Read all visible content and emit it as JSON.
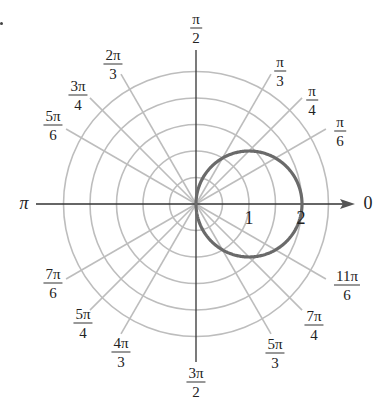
{
  "figure": {
    "colors": {
      "grid": "#bdbdbd",
      "axis": "#333333",
      "curve": "#6a6a6a",
      "text": "#222222"
    },
    "center_px": [
      196,
      204
    ],
    "unit_px": 53,
    "grid_circle_radii": [
      0.5,
      1,
      1.5,
      2,
      2.5
    ],
    "axis_end_label": "0",
    "pi_label": "π"
  },
  "chart_data": {
    "type": "line",
    "coordinate_system": "polar",
    "title": "",
    "curve": {
      "equation": "r = 2cos θ",
      "shape": "circle through origin, diameter 2, centered at (1, 0)",
      "points": [
        {
          "theta": "0",
          "r": 2
        },
        {
          "theta": "π/6",
          "r": 1.732
        },
        {
          "theta": "π/4",
          "r": 1.414
        },
        {
          "theta": "π/3",
          "r": 1
        },
        {
          "theta": "π/2",
          "r": 0
        },
        {
          "theta": "-π/3",
          "r": 1
        },
        {
          "theta": "-π/4",
          "r": 1.414
        },
        {
          "theta": "-π/6",
          "r": 1.732
        }
      ]
    },
    "radial_tick_labels": [
      {
        "value": 1,
        "label": "1"
      },
      {
        "value": 2,
        "label": "2"
      }
    ],
    "angle_labels": [
      {
        "num": "π",
        "den": "2",
        "deg": 90,
        "pos": [
          196,
          28
        ]
      },
      {
        "num": "π",
        "den": "3",
        "deg": 60,
        "pos": [
          280,
          71
        ]
      },
      {
        "num": "π",
        "den": "4",
        "deg": 45,
        "pos": [
          312,
          100
        ]
      },
      {
        "num": "π",
        "den": "6",
        "deg": 30,
        "pos": [
          340,
          131
        ]
      },
      {
        "num": "2π",
        "den": "3",
        "deg": 120,
        "pos": [
          113,
          64
        ]
      },
      {
        "num": "3π",
        "den": "4",
        "deg": 135,
        "pos": [
          78,
          95
        ]
      },
      {
        "num": "5π",
        "den": "6",
        "deg": 150,
        "pos": [
          53,
          125
        ]
      },
      {
        "num": "7π",
        "den": "6",
        "deg": 210,
        "pos": [
          53,
          283
        ]
      },
      {
        "num": "5π",
        "den": "4",
        "deg": 225,
        "pos": [
          83,
          323
        ]
      },
      {
        "num": "4π",
        "den": "3",
        "deg": 240,
        "pos": [
          121,
          352
        ]
      },
      {
        "num": "3π",
        "den": "2",
        "deg": 270,
        "pos": [
          196,
          382
        ]
      },
      {
        "num": "5π",
        "den": "3",
        "deg": 300,
        "pos": [
          275,
          353
        ]
      },
      {
        "num": "7π",
        "den": "4",
        "deg": 315,
        "pos": [
          314,
          325
        ]
      },
      {
        "num": "11π",
        "den": "6",
        "deg": 330,
        "pos": [
          347,
          285
        ]
      }
    ],
    "single_angle_labels": [
      {
        "label": "0",
        "deg": 0,
        "pos": [
          368,
          203
        ]
      },
      {
        "label": "π",
        "deg": 180,
        "pos": [
          24,
          203
        ]
      }
    ],
    "grid": true,
    "rlim": [
      0,
      2.5
    ]
  }
}
